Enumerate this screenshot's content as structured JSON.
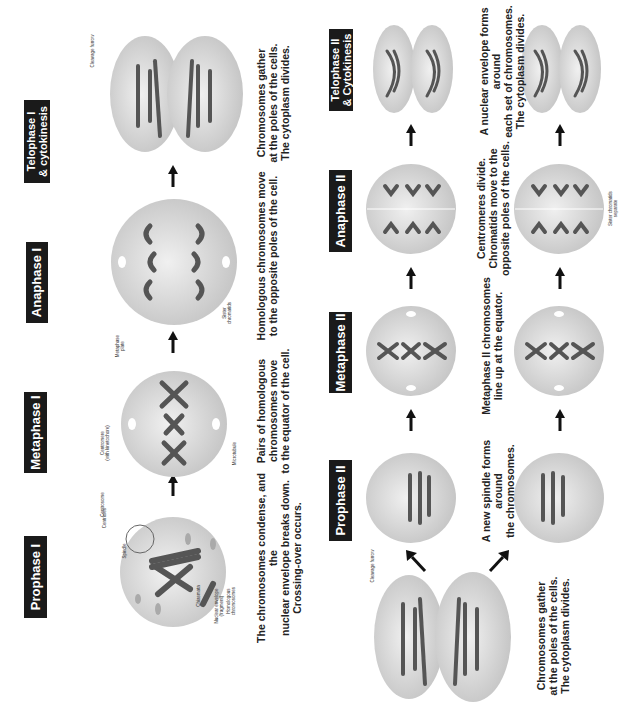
{
  "diagram": {
    "colors": {
      "label_bg": "#1a1a1a",
      "label_text": "#ffffff",
      "cell_fill": "#d9d9d9",
      "chromosome": "#4a4a4a",
      "text": "#222222"
    },
    "meiosis_1": {
      "stages": [
        {
          "name": "Prophase I",
          "description": "The chromosomes condense, and the\nnuclear envelope breaks down.\nCrossing-over occurs.",
          "annotations": [
            "Centrioles",
            "Spindle",
            "Nuclear envelope\n(fragment)",
            "Centrosome",
            "Chiasmata",
            "Homologous\nchromosomes"
          ]
        },
        {
          "name": "Metaphase I",
          "description": "Pairs of homologous\nchromosomes move\nto the equator of the cell.",
          "annotations": [
            "Metaphase\nplate",
            "Centromere\n(with kinetochore)",
            "Microtubule"
          ]
        },
        {
          "name": "Anaphase I",
          "description": "Homologous chromosomes move\nto the opposite poles of the cell.",
          "annotations": [
            "Sister\nchromatids"
          ]
        },
        {
          "name": "Telophase I\n& cytokinesis",
          "description": "Chromosomes gather\nat the poles of the cells.\nThe cytoplasm divides.",
          "annotations": [
            "Cleavage furrow"
          ]
        }
      ]
    },
    "meiosis_2": {
      "start_cell": {
        "description": "Chromosomes gather\nat the poles of the cells.\nThe cytoplasm divides.",
        "annotations": [
          "Cleavage furrow"
        ]
      },
      "stages": [
        {
          "name": "Prophase II",
          "description": "A new spindle forms around\nthe chromosomes.",
          "annotations": []
        },
        {
          "name": "Metaphase II",
          "description": "Metaphase II chromosomes\nline up at the equator.",
          "annotations": []
        },
        {
          "name": "Anaphase II",
          "description": "Centromeres divide.\nChromatids move to the\nopposite poles of the cells.",
          "annotations": [
            "Sister chromatids\nseparate"
          ]
        },
        {
          "name": "Telophase II\n& Cytokinesis",
          "description": "A nuclear envelope forms around\neach set of chromosomes.\nThe cytoplasm divides.",
          "annotations": []
        }
      ]
    }
  }
}
